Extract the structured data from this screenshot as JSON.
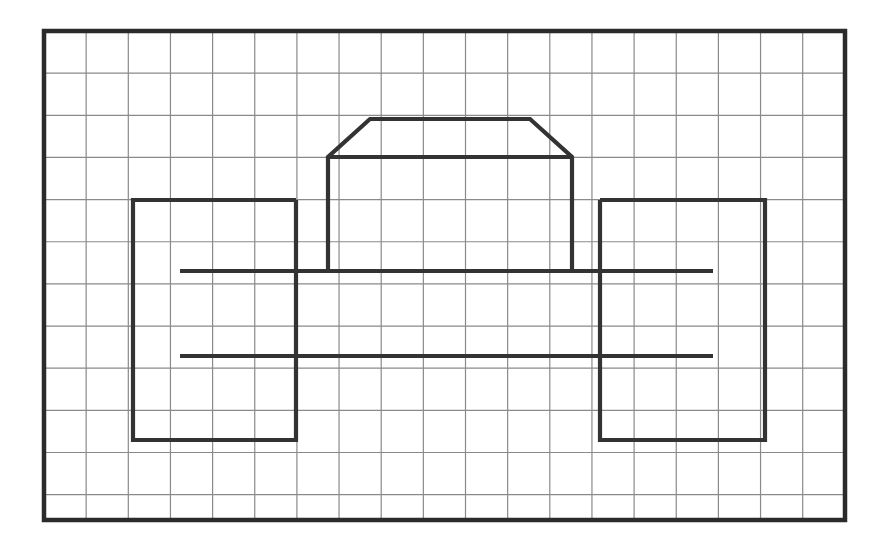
{
  "figure": {
    "title": "Grid-paper line drawing of a car silhouette",
    "canvas": {
      "width": 894,
      "height": 557,
      "background": "#ffffff"
    },
    "grid": {
      "origin_x": 44,
      "origin_y": 31,
      "cell": 42.15,
      "cols": 19,
      "rows": 11.6,
      "line_color": "#8a8a8a",
      "line_width": 1.2,
      "border_color": "#2b2b2b",
      "border_width": 4.5,
      "width": 801,
      "height": 489
    },
    "drawing": {
      "stroke_color": "#333333",
      "stroke_width": 4.2,
      "shapes": [
        {
          "name": "cabin-trapezoid",
          "type": "polyline",
          "points": "328,271 328,157 370,119 530,119 572,157 572,271"
        },
        {
          "name": "cabin-base-line",
          "type": "line",
          "points": "328,157 572,157"
        },
        {
          "name": "left-wheel-box",
          "type": "polyline",
          "points": "296,200 133,200 133,440 296,440 296,200"
        },
        {
          "name": "right-wheel-box",
          "type": "polyline",
          "points": "600,200 765,200 765,440 600,440 600,200"
        },
        {
          "name": "upper-body-line",
          "type": "line",
          "points": "180,271 713,271"
        },
        {
          "name": "lower-body-line",
          "type": "line",
          "points": "180,356 713,356"
        }
      ]
    }
  }
}
